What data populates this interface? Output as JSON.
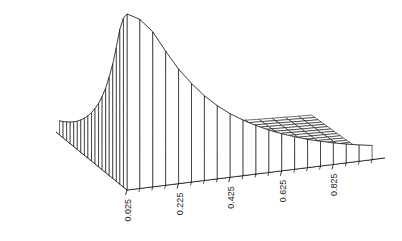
{
  "figure": {
    "background_color": "#ffffff",
    "line_color": "#000000",
    "width": 402,
    "height": 241
  },
  "chart_data": {
    "type": "surface",
    "title": "",
    "subtitle": "",
    "xlabel": "",
    "ylabel": "",
    "zlabel": "",
    "grid": false,
    "legend": null,
    "projection": "3d-wireframe-mesh",
    "shading": "white-faces-black-edges",
    "x": {
      "axis": "bottom-right",
      "tick_labels": [
        "0.025",
        "0.225",
        "0.425",
        "0.625",
        "0.825"
      ],
      "tick_values": [
        0.025,
        0.225,
        0.425,
        0.625,
        0.825
      ],
      "range": [
        0.025,
        0.975
      ],
      "step": 0.05,
      "n_cells": 20
    },
    "y": {
      "axis": "bottom-left",
      "tick_labels": [
        "0.025",
        "0.225",
        "0.425",
        "0.625",
        "0.825"
      ],
      "tick_values": [
        0.025,
        0.225,
        0.425,
        0.625,
        0.825
      ],
      "range": [
        0.025,
        0.975
      ],
      "step": 0.05,
      "n_cells": 20
    },
    "z": {
      "axis": "vertical",
      "tick_labels": [],
      "range": [
        0,
        1
      ],
      "peak_location": [
        0.025,
        0.025
      ],
      "peak_value": 1.0
    },
    "surface_values": [
      [
        1.0,
        0.96,
        0.88,
        0.76,
        0.65,
        0.56,
        0.48,
        0.415,
        0.36,
        0.315,
        0.275,
        0.24,
        0.21,
        0.184,
        0.16,
        0.14,
        0.122,
        0.106,
        0.092,
        0.08
      ],
      [
        0.96,
        0.72,
        0.54,
        0.42,
        0.336,
        0.274,
        0.228,
        0.192,
        0.164,
        0.141,
        0.122,
        0.106,
        0.093,
        0.081,
        0.071,
        0.062,
        0.055,
        0.048,
        0.042,
        0.037
      ],
      [
        0.88,
        0.54,
        0.37,
        0.272,
        0.209,
        0.166,
        0.135,
        0.112,
        0.094,
        0.08,
        0.069,
        0.06,
        0.052,
        0.045,
        0.04,
        0.035,
        0.031,
        0.027,
        0.024,
        0.021
      ],
      [
        0.76,
        0.42,
        0.272,
        0.192,
        0.144,
        0.112,
        0.09,
        0.074,
        0.062,
        0.052,
        0.045,
        0.039,
        0.034,
        0.029,
        0.026,
        0.023,
        0.02,
        0.018,
        0.016,
        0.014
      ],
      [
        0.65,
        0.336,
        0.209,
        0.144,
        0.106,
        0.081,
        0.065,
        0.053,
        0.044,
        0.037,
        0.032,
        0.027,
        0.024,
        0.021,
        0.018,
        0.016,
        0.014,
        0.013,
        0.011,
        0.01
      ],
      [
        0.56,
        0.274,
        0.166,
        0.112,
        0.081,
        0.062,
        0.049,
        0.04,
        0.033,
        0.028,
        0.024,
        0.02,
        0.018,
        0.015,
        0.014,
        0.012,
        0.011,
        0.009,
        0.008,
        0.007
      ],
      [
        0.48,
        0.228,
        0.135,
        0.09,
        0.065,
        0.049,
        0.039,
        0.031,
        0.026,
        0.022,
        0.018,
        0.016,
        0.014,
        0.012,
        0.01,
        0.009,
        0.008,
        0.007,
        0.006,
        0.006
      ],
      [
        0.415,
        0.192,
        0.112,
        0.074,
        0.053,
        0.04,
        0.031,
        0.025,
        0.021,
        0.018,
        0.015,
        0.013,
        0.011,
        0.01,
        0.008,
        0.007,
        0.007,
        0.006,
        0.005,
        0.005
      ],
      [
        0.36,
        0.164,
        0.094,
        0.062,
        0.044,
        0.033,
        0.026,
        0.021,
        0.017,
        0.014,
        0.012,
        0.011,
        0.009,
        0.008,
        0.007,
        0.006,
        0.005,
        0.005,
        0.004,
        0.004
      ],
      [
        0.315,
        0.141,
        0.08,
        0.052,
        0.037,
        0.028,
        0.022,
        0.018,
        0.014,
        0.012,
        0.01,
        0.009,
        0.008,
        0.007,
        0.006,
        0.005,
        0.005,
        0.004,
        0.004,
        0.003
      ],
      [
        0.275,
        0.122,
        0.069,
        0.045,
        0.032,
        0.024,
        0.018,
        0.015,
        0.012,
        0.01,
        0.009,
        0.008,
        0.007,
        0.006,
        0.005,
        0.004,
        0.004,
        0.003,
        0.003,
        0.003
      ],
      [
        0.24,
        0.106,
        0.06,
        0.039,
        0.027,
        0.02,
        0.016,
        0.013,
        0.011,
        0.009,
        0.008,
        0.007,
        0.006,
        0.005,
        0.004,
        0.004,
        0.003,
        0.003,
        0.003,
        0.002
      ],
      [
        0.21,
        0.093,
        0.052,
        0.034,
        0.024,
        0.018,
        0.014,
        0.011,
        0.009,
        0.008,
        0.007,
        0.006,
        0.005,
        0.004,
        0.004,
        0.003,
        0.003,
        0.003,
        0.002,
        0.002
      ],
      [
        0.184,
        0.081,
        0.045,
        0.029,
        0.021,
        0.015,
        0.012,
        0.01,
        0.008,
        0.007,
        0.006,
        0.005,
        0.004,
        0.004,
        0.003,
        0.003,
        0.003,
        0.002,
        0.002,
        0.002
      ],
      [
        0.16,
        0.071,
        0.04,
        0.026,
        0.018,
        0.014,
        0.01,
        0.008,
        0.007,
        0.006,
        0.005,
        0.004,
        0.004,
        0.003,
        0.003,
        0.003,
        0.002,
        0.002,
        0.002,
        0.002
      ],
      [
        0.14,
        0.062,
        0.035,
        0.023,
        0.016,
        0.012,
        0.009,
        0.007,
        0.006,
        0.005,
        0.004,
        0.004,
        0.003,
        0.003,
        0.003,
        0.002,
        0.002,
        0.002,
        0.002,
        0.001
      ],
      [
        0.122,
        0.055,
        0.031,
        0.02,
        0.014,
        0.011,
        0.008,
        0.007,
        0.005,
        0.005,
        0.004,
        0.003,
        0.003,
        0.003,
        0.002,
        0.002,
        0.002,
        0.002,
        0.001,
        0.001
      ],
      [
        0.106,
        0.048,
        0.027,
        0.018,
        0.013,
        0.009,
        0.007,
        0.006,
        0.005,
        0.004,
        0.003,
        0.003,
        0.003,
        0.002,
        0.002,
        0.002,
        0.002,
        0.001,
        0.001,
        0.001
      ],
      [
        0.092,
        0.042,
        0.024,
        0.016,
        0.011,
        0.008,
        0.006,
        0.005,
        0.004,
        0.004,
        0.003,
        0.003,
        0.002,
        0.002,
        0.002,
        0.002,
        0.001,
        0.001,
        0.001,
        0.001
      ],
      [
        0.08,
        0.037,
        0.021,
        0.014,
        0.01,
        0.007,
        0.006,
        0.005,
        0.004,
        0.003,
        0.003,
        0.002,
        0.002,
        0.002,
        0.002,
        0.001,
        0.001,
        0.001,
        0.001,
        0.001
      ]
    ]
  },
  "axes": {
    "left_axis": {
      "name": "y-axis",
      "tick_labels": [
        "0.825",
        "0.625",
        "0.425",
        "0.225",
        "0.025"
      ]
    },
    "bottom_axis": {
      "name": "x-axis",
      "tick_labels": [
        "0.025",
        "0.225",
        "0.425",
        "0.625",
        "0.825"
      ]
    }
  }
}
